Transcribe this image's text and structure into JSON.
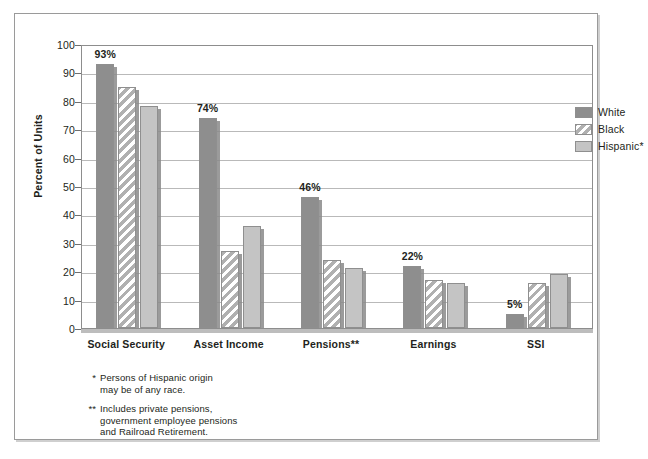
{
  "chart_data": {
    "type": "bar",
    "title": "",
    "subtitle": "",
    "xlabel": "",
    "ylabel": "Percent of Units",
    "ylim": [
      0,
      100
    ],
    "ytick_step": 10,
    "yticks": [
      100,
      90,
      80,
      70,
      60,
      50,
      40,
      30,
      20,
      10,
      0
    ],
    "ytick_labels": [
      "100",
      "90",
      "80",
      "70",
      "60",
      "50",
      "40",
      "30",
      "20",
      "10",
      "0"
    ],
    "grid": true,
    "grid_axis": "y",
    "legend_position": "top-right-inside",
    "categories": [
      "Social Security",
      "Asset Income",
      "Pensions**",
      "Earnings",
      "SSI"
    ],
    "series": [
      {
        "name": "White",
        "swatch": "solid-dark-gray",
        "color": "#8e8e8e",
        "values": [
          93,
          74,
          46,
          22,
          5
        ],
        "value_labels": [
          "93%",
          "74%",
          "46%",
          "22%",
          "5%"
        ]
      },
      {
        "name": "Black",
        "swatch": "diagonal-hatch",
        "color": "#b0b0b0",
        "values": [
          85,
          27,
          24,
          17,
          16
        ],
        "value_labels": [
          "",
          "",
          "",
          "",
          ""
        ]
      },
      {
        "name": "Hispanic*",
        "swatch": "solid-light-gray",
        "color": "#c4c4c4",
        "values": [
          78,
          36,
          21,
          16,
          19
        ],
        "value_labels": [
          "",
          "",
          "",
          "",
          ""
        ]
      }
    ],
    "annotations": [
      "* Persons of Hispanic origin may be of any race.",
      "** Includes private pensions, government employee pensions and Railroad Retirement."
    ]
  },
  "legend": {
    "items": [
      {
        "label": "White"
      },
      {
        "label": "Black"
      },
      {
        "label": "Hispanic*"
      }
    ]
  },
  "footnotes": [
    {
      "marker": "*",
      "lines": [
        "Persons of Hispanic origin",
        "may be of any race."
      ]
    },
    {
      "marker": "**",
      "lines": [
        "Includes private pensions,",
        "government employee pensions",
        "and Railroad Retirement."
      ]
    }
  ],
  "colors": {
    "white_series": "#8e8e8e",
    "black_series": "#b0b0b0",
    "hispanic_series": "#c4c4c4",
    "gridline": "#b9b9b9",
    "axis": "#8d8d8d",
    "text": "#231f20",
    "frame": "#9a9a9a"
  }
}
